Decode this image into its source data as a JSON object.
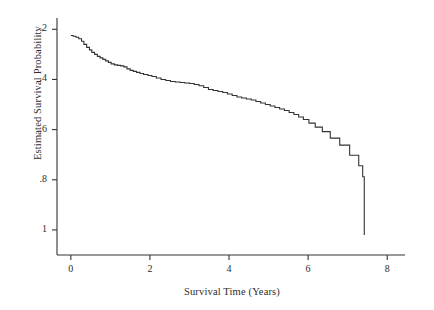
{
  "chart_data": {
    "type": "line",
    "subtype": "kaplan-meier-step",
    "title": "",
    "xlabel": "Survival Time (Years)",
    "ylabel": "Estimated Survival Probability",
    "xlim": [
      -0.35,
      8.45
    ],
    "ylim": [
      0.1,
      1.045
    ],
    "xticks": [
      0,
      2,
      4,
      6,
      8
    ],
    "xticklabels": [
      "0",
      "2",
      "4",
      "6",
      "8"
    ],
    "yticks": [
      0.2,
      0.4,
      0.6,
      0.8,
      1.0
    ],
    "yticklabels": [
      ".2",
      ".4",
      ".6",
      ".8",
      "1"
    ],
    "grid": false,
    "legend": null,
    "line_color": "#333333",
    "line_width": 1.1,
    "background": "#ffffff",
    "series": [
      {
        "name": "Estimated Survival Probability",
        "step": "post",
        "x": [
          0.0,
          0.06,
          0.13,
          0.2,
          0.27,
          0.33,
          0.4,
          0.47,
          0.53,
          0.6,
          0.67,
          0.74,
          0.81,
          0.88,
          0.95,
          1.02,
          1.1,
          1.18,
          1.26,
          1.34,
          1.42,
          1.5,
          1.58,
          1.66,
          1.75,
          1.84,
          1.95,
          2.05,
          2.16,
          2.28,
          2.4,
          2.52,
          2.64,
          2.76,
          2.88,
          3.0,
          3.12,
          3.24,
          3.36,
          3.48,
          3.6,
          3.72,
          3.84,
          3.96,
          4.08,
          4.2,
          4.32,
          4.44,
          4.56,
          4.68,
          4.8,
          4.92,
          5.04,
          5.16,
          5.28,
          5.4,
          5.52,
          5.64,
          5.76,
          5.88,
          6.02,
          6.18,
          6.36,
          6.56,
          6.8,
          7.05,
          7.28,
          7.38,
          7.42
        ],
        "y": [
          0.975,
          0.972,
          0.968,
          0.962,
          0.952,
          0.94,
          0.928,
          0.918,
          0.908,
          0.9,
          0.892,
          0.886,
          0.88,
          0.874,
          0.868,
          0.862,
          0.858,
          0.856,
          0.854,
          0.85,
          0.842,
          0.836,
          0.832,
          0.828,
          0.824,
          0.82,
          0.816,
          0.812,
          0.806,
          0.8,
          0.796,
          0.792,
          0.79,
          0.788,
          0.786,
          0.784,
          0.78,
          0.775,
          0.768,
          0.76,
          0.756,
          0.752,
          0.748,
          0.742,
          0.736,
          0.73,
          0.726,
          0.722,
          0.718,
          0.712,
          0.706,
          0.7,
          0.694,
          0.688,
          0.682,
          0.676,
          0.668,
          0.66,
          0.65,
          0.64,
          0.626,
          0.61,
          0.592,
          0.566,
          0.538,
          0.498,
          0.456,
          0.412,
          0.18
        ]
      }
    ]
  },
  "axes": {
    "y_title": "Estimated Survival Probability",
    "x_title": "Survival Time (Years)",
    "x_tick_labels": [
      "0",
      "2",
      "4",
      "6",
      "8"
    ],
    "y_tick_labels": [
      "1",
      ".8",
      ".6",
      ".4",
      ".2"
    ]
  }
}
